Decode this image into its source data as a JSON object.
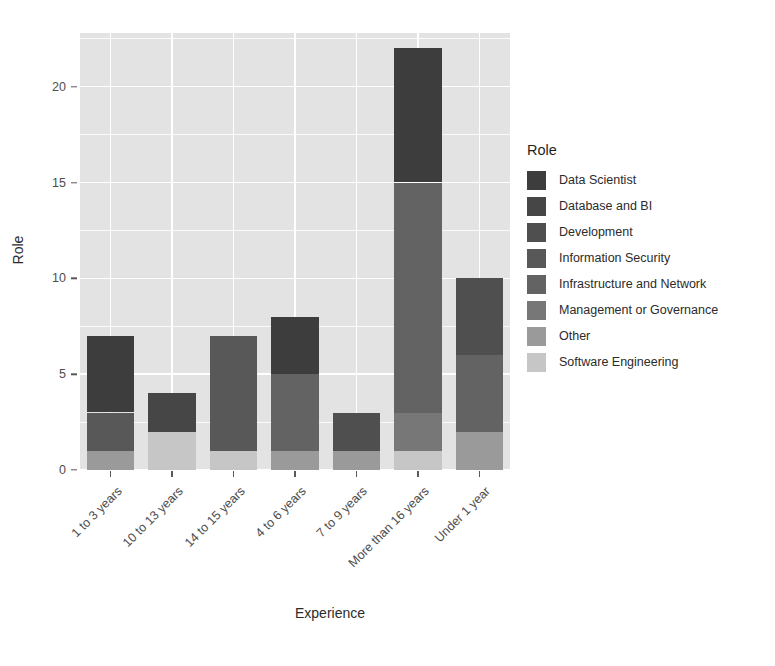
{
  "chart_data": {
    "type": "bar",
    "title": "",
    "xlabel": "Experience",
    "ylabel": "Role",
    "stacked": true,
    "grid": true,
    "legend_position": "right",
    "legend_title": "Role",
    "ylim": [
      0,
      22.8
    ],
    "yticks": [
      0,
      5,
      10,
      15,
      20
    ],
    "ytick_labels": [
      "0",
      "5",
      "10",
      "15",
      "20"
    ],
    "categories": [
      "1 to 3 years",
      "10 to 13 years",
      "14 to 15 years",
      "4 to 6 years",
      "7 to 9 years",
      "More than 16 years",
      "Under 1 year"
    ],
    "series": [
      {
        "name": "Data Scientist",
        "color": "#3d3d3d",
        "values": [
          4,
          0,
          0,
          3,
          0,
          7,
          0
        ]
      },
      {
        "name": "Database and BI",
        "color": "#464646",
        "values": [
          0,
          2,
          0,
          0,
          0,
          0,
          0
        ]
      },
      {
        "name": "Development",
        "color": "#4f4f4f",
        "values": [
          0,
          0,
          0,
          0,
          2,
          0,
          4
        ]
      },
      {
        "name": "Information Security",
        "color": "#585858",
        "values": [
          2,
          0,
          6,
          0,
          0,
          0,
          0
        ]
      },
      {
        "name": "Infrastructure and Network",
        "color": "#636363",
        "values": [
          0,
          0,
          0,
          4,
          0,
          12,
          4
        ]
      },
      {
        "name": "Management or Governance",
        "color": "#777777",
        "values": [
          0,
          0,
          0,
          0,
          0,
          2,
          0
        ]
      },
      {
        "name": "Other",
        "color": "#9a9a9a",
        "values": [
          1,
          0,
          0,
          1,
          1,
          0,
          2
        ]
      },
      {
        "name": "Software Engineering",
        "color": "#c6c6c6",
        "values": [
          0,
          2,
          1,
          0,
          0,
          1,
          0
        ]
      }
    ],
    "bar_totals": [
      7,
      4,
      7,
      8,
      3,
      22,
      10
    ]
  }
}
